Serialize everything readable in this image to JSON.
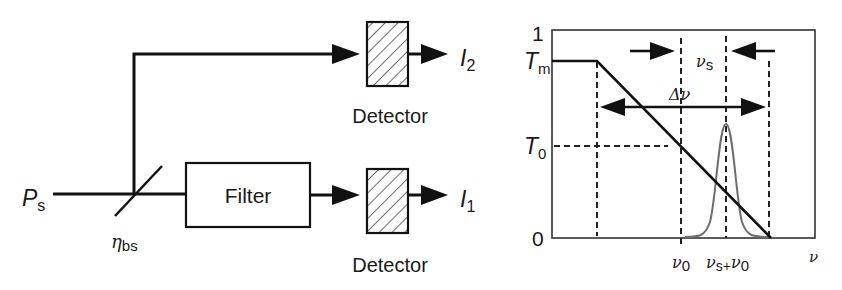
{
  "setup": {
    "input_label": "P",
    "input_sub": "s",
    "beamsplitter_label": "η",
    "beamsplitter_sub": "bs",
    "filter_label": "Filter",
    "detector_top_label": "Detector",
    "detector_bottom_label": "Detector",
    "output_top_label": "I",
    "output_top_sub": "2",
    "output_bottom_label": "I",
    "output_bottom_sub": "1"
  },
  "plot": {
    "y_tick_1": "1",
    "y_tick_tm": "T",
    "y_tick_tm_sub": "m",
    "y_tick_t0": "T",
    "y_tick_t0_sub": "0",
    "y_tick_0": "0",
    "x_tick_nu0": "ν",
    "x_tick_nu0_sub": "0",
    "x_tick_nus": "ν",
    "x_tick_nus_sub": "s+",
    "x_tick_nus_nu0": "ν",
    "x_tick_nus_nu0_sub": "0",
    "x_axis_label": "ν",
    "delta_nu_label": "Δν",
    "nu_s_label": "ν",
    "nu_s_sub": "s"
  },
  "colors": {
    "line": "#111111",
    "signal_curve": "#6e6e6e",
    "frame": "#333333"
  }
}
